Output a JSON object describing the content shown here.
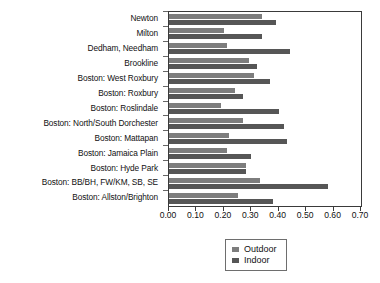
{
  "chart_data": {
    "type": "bar",
    "orientation": "horizontal",
    "title": "",
    "xlabel": "",
    "ylabel": "",
    "xlim": [
      0.0,
      0.7
    ],
    "grid": false,
    "legend_position": "bottom-center",
    "xticks": [
      "0.00",
      "0.10",
      "0.20",
      "0.30",
      "0.40",
      "0.50",
      "0.60",
      "0.70"
    ],
    "xtick_values": [
      0.0,
      0.1,
      0.2,
      0.3,
      0.4,
      0.5,
      0.6,
      0.7
    ],
    "categories": [
      "Newton",
      "Milton",
      "Dedham, Needham",
      "Brookline",
      "Boston: West Roxbury",
      "Boston: Roxbury",
      "Boston: Roslindale",
      "Boston: North/South Dorchester",
      "Boston: Mattapan",
      "Boston: Jamaica Plain",
      "Boston: Hyde Park",
      "Boston: BB/BH, FW/KM, SB, SE",
      "Boston: Allston/Brighton"
    ],
    "series": [
      {
        "name": "Outdoor",
        "color": "#7d7d7d",
        "values": [
          0.34,
          0.2,
          0.21,
          0.29,
          0.31,
          0.24,
          0.19,
          0.27,
          0.22,
          0.21,
          0.28,
          0.33,
          0.25
        ]
      },
      {
        "name": "Indoor",
        "color": "#565656",
        "values": [
          0.39,
          0.34,
          0.44,
          0.32,
          0.37,
          0.27,
          0.4,
          0.42,
          0.43,
          0.3,
          0.28,
          0.58,
          0.38
        ]
      }
    ]
  },
  "legend": {
    "items": [
      {
        "label": "Outdoor",
        "swatch": "outdoor-swatch"
      },
      {
        "label": "Indoor",
        "swatch": "indoor-swatch"
      }
    ]
  }
}
